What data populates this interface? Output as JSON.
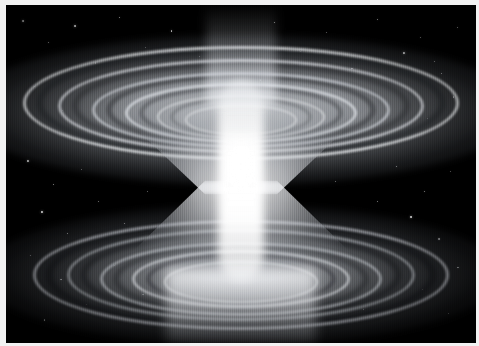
{
  "image": {
    "kind": "astronomical-visualization",
    "subject": "wormhole",
    "alt_text": "Grayscale rendering of a wormhole: an hourglass-shaped funnel with concentric accretion-disk rings flaring outward above and below a narrow bright throat, set against a black starfield.",
    "palette": "grayscale",
    "width_px": 479,
    "height_px": 346
  },
  "frame": {
    "border_color": "#f2f2f2",
    "inset_left_px": 6,
    "inset_top_px": 5
  },
  "scene": {
    "background_color": "#000000",
    "highlight_color": "#ffffff",
    "midtone_color": "#8c9096",
    "shadow_color": "#0a0b0d",
    "texture": "vertical-scanlines"
  },
  "features": [
    {
      "name": "upper-accretion-disk",
      "label": "Upper accretion disk",
      "center_x_pct": 50,
      "center_y_pct": 31,
      "ring_count": 5
    },
    {
      "name": "lower-accretion-disk",
      "label": "Lower accretion disk",
      "center_x_pct": 50,
      "center_y_pct": 80,
      "ring_count": 5
    },
    {
      "name": "wormhole-throat",
      "label": "Wormhole throat",
      "center_x_pct": 50,
      "center_y_pct": 52,
      "narrowest_width_px": 30
    },
    {
      "name": "upper-light-beam",
      "label": "Upper light beam",
      "center_x_pct": 50,
      "top_pct": 0
    },
    {
      "name": "lower-light-beam",
      "label": "Lower light glow",
      "center_x_pct": 50,
      "bottom_pct": 0
    }
  ],
  "upper_rings": [
    {
      "w": 430,
      "h": 108,
      "y": 29,
      "color": "rgba(236,238,241,0.85)",
      "thickness": 3,
      "blur": 1.2
    },
    {
      "w": 360,
      "h": 88,
      "y": 30,
      "color": "rgba(222,225,230,0.80)",
      "thickness": 3,
      "blur": 1.2
    },
    {
      "w": 292,
      "h": 70,
      "y": 31,
      "color": "rgba(208,212,218,0.78)",
      "thickness": 3,
      "blur": 1.1
    },
    {
      "w": 226,
      "h": 54,
      "y": 32,
      "color": "rgba(226,229,234,0.82)",
      "thickness": 3,
      "blur": 1.0
    },
    {
      "w": 164,
      "h": 40,
      "y": 33,
      "color": "rgba(240,242,245,0.80)",
      "thickness": 2,
      "blur": 0.9
    },
    {
      "w": 108,
      "h": 27,
      "y": 34,
      "color": "rgba(248,249,251,0.72)",
      "thickness": 2,
      "blur": 0.8
    }
  ],
  "upper_gaps": [
    {
      "w": 396,
      "h": 98,
      "y": 29,
      "color": "rgba(30,32,36,0.55)",
      "thickness": 7,
      "blur": 2.2
    },
    {
      "w": 326,
      "h": 79,
      "y": 30,
      "color": "rgba(36,38,43,0.52)",
      "thickness": 6,
      "blur": 2.0
    },
    {
      "w": 258,
      "h": 62,
      "y": 31,
      "color": "rgba(44,46,51,0.48)",
      "thickness": 6,
      "blur": 1.8
    },
    {
      "w": 194,
      "h": 47,
      "y": 32,
      "color": "rgba(52,55,60,0.42)",
      "thickness": 5,
      "blur": 1.6
    },
    {
      "w": 134,
      "h": 33,
      "y": 33,
      "color": "rgba(62,65,70,0.35)",
      "thickness": 4,
      "blur": 1.4
    }
  ],
  "lower_rings": [
    {
      "w": 410,
      "h": 104,
      "y": 80,
      "color": "rgba(196,200,206,0.70)",
      "thickness": 3,
      "blur": 1.3
    },
    {
      "w": 342,
      "h": 86,
      "y": 80,
      "color": "rgba(182,186,192,0.68)",
      "thickness": 3,
      "blur": 1.2
    },
    {
      "w": 276,
      "h": 68,
      "y": 81,
      "color": "rgba(200,204,210,0.70)",
      "thickness": 3,
      "blur": 1.1
    },
    {
      "w": 212,
      "h": 52,
      "y": 81,
      "color": "rgba(222,225,230,0.74)",
      "thickness": 3,
      "blur": 1.0
    },
    {
      "w": 150,
      "h": 38,
      "y": 82,
      "color": "rgba(240,242,245,0.72)",
      "thickness": 2,
      "blur": 0.9
    }
  ],
  "lower_gaps": [
    {
      "w": 376,
      "h": 95,
      "y": 80,
      "color": "rgba(18,19,22,0.62)",
      "thickness": 8,
      "blur": 2.4
    },
    {
      "w": 308,
      "h": 77,
      "y": 80,
      "color": "rgba(24,26,29,0.58)",
      "thickness": 7,
      "blur": 2.2
    },
    {
      "w": 244,
      "h": 60,
      "y": 81,
      "color": "rgba(32,34,38,0.52)",
      "thickness": 6,
      "blur": 2.0
    },
    {
      "w": 180,
      "h": 44,
      "y": 81,
      "color": "rgba(40,42,47,0.44)",
      "thickness": 5,
      "blur": 1.7
    }
  ],
  "stars": [
    {
      "x": 3.5,
      "y": 4.5,
      "s": 1.4,
      "o": 0.75
    },
    {
      "x": 9.0,
      "y": 11.0,
      "s": 1.2,
      "o": 0.62
    },
    {
      "x": 14.5,
      "y": 6.0,
      "s": 1.6,
      "o": 0.85
    },
    {
      "x": 19.0,
      "y": 17.0,
      "s": 1.1,
      "o": 0.55
    },
    {
      "x": 24.0,
      "y": 3.5,
      "s": 1.3,
      "o": 0.7
    },
    {
      "x": 29.5,
      "y": 12.5,
      "s": 1.0,
      "o": 0.48
    },
    {
      "x": 35.0,
      "y": 7.5,
      "s": 1.5,
      "o": 0.8
    },
    {
      "x": 41.0,
      "y": 15.0,
      "s": 1.1,
      "o": 0.52
    },
    {
      "x": 57.0,
      "y": 5.0,
      "s": 1.3,
      "o": 0.72
    },
    {
      "x": 62.5,
      "y": 13.5,
      "s": 1.2,
      "o": 0.6
    },
    {
      "x": 68.0,
      "y": 8.0,
      "s": 1.0,
      "o": 0.5
    },
    {
      "x": 73.5,
      "y": 18.5,
      "s": 1.5,
      "o": 0.82
    },
    {
      "x": 79.0,
      "y": 4.0,
      "s": 1.2,
      "o": 0.66
    },
    {
      "x": 84.5,
      "y": 14.0,
      "s": 1.7,
      "o": 0.9
    },
    {
      "x": 88.0,
      "y": 9.5,
      "s": 1.1,
      "o": 0.55
    },
    {
      "x": 92.5,
      "y": 20.0,
      "s": 1.4,
      "o": 0.76
    },
    {
      "x": 96.0,
      "y": 6.5,
      "s": 1.2,
      "o": 0.64
    },
    {
      "x": 91.0,
      "y": 16.5,
      "s": 1.3,
      "o": 0.7
    },
    {
      "x": 6.0,
      "y": 24.0,
      "s": 1.2,
      "o": 0.58
    },
    {
      "x": 12.0,
      "y": 31.0,
      "s": 1.0,
      "o": 0.45
    },
    {
      "x": 95.0,
      "y": 27.0,
      "s": 1.3,
      "o": 0.68
    },
    {
      "x": 89.5,
      "y": 33.5,
      "s": 1.1,
      "o": 0.52
    },
    {
      "x": 4.5,
      "y": 46.0,
      "s": 1.5,
      "o": 0.8
    },
    {
      "x": 10.0,
      "y": 53.0,
      "s": 1.2,
      "o": 0.6
    },
    {
      "x": 16.0,
      "y": 48.5,
      "s": 1.0,
      "o": 0.46
    },
    {
      "x": 7.5,
      "y": 61.0,
      "s": 1.6,
      "o": 0.86
    },
    {
      "x": 13.0,
      "y": 67.5,
      "s": 1.3,
      "o": 0.7
    },
    {
      "x": 19.5,
      "y": 58.0,
      "s": 1.1,
      "o": 0.54
    },
    {
      "x": 25.0,
      "y": 64.5,
      "s": 1.4,
      "o": 0.74
    },
    {
      "x": 5.0,
      "y": 74.0,
      "s": 1.2,
      "o": 0.62
    },
    {
      "x": 11.5,
      "y": 81.0,
      "s": 1.5,
      "o": 0.78
    },
    {
      "x": 17.0,
      "y": 88.5,
      "s": 1.1,
      "o": 0.5
    },
    {
      "x": 23.0,
      "y": 77.0,
      "s": 1.0,
      "o": 0.44
    },
    {
      "x": 29.0,
      "y": 85.5,
      "s": 1.3,
      "o": 0.66
    },
    {
      "x": 8.0,
      "y": 93.0,
      "s": 1.2,
      "o": 0.58
    },
    {
      "x": 83.0,
      "y": 47.5,
      "s": 1.4,
      "o": 0.76
    },
    {
      "x": 89.0,
      "y": 55.0,
      "s": 1.2,
      "o": 0.62
    },
    {
      "x": 94.5,
      "y": 49.0,
      "s": 1.0,
      "o": 0.46
    },
    {
      "x": 86.0,
      "y": 62.5,
      "s": 1.6,
      "o": 0.84
    },
    {
      "x": 92.0,
      "y": 69.0,
      "s": 1.3,
      "o": 0.68
    },
    {
      "x": 79.0,
      "y": 58.0,
      "s": 1.1,
      "o": 0.52
    },
    {
      "x": 96.0,
      "y": 77.5,
      "s": 1.4,
      "o": 0.72
    },
    {
      "x": 88.5,
      "y": 84.0,
      "s": 1.2,
      "o": 0.6
    },
    {
      "x": 94.0,
      "y": 91.0,
      "s": 1.0,
      "o": 0.44
    },
    {
      "x": 76.0,
      "y": 90.0,
      "s": 1.3,
      "o": 0.64
    },
    {
      "x": 33.0,
      "y": 43.0,
      "s": 1.1,
      "o": 0.55
    },
    {
      "x": 67.0,
      "y": 41.0,
      "s": 1.2,
      "o": 0.58
    },
    {
      "x": 30.0,
      "y": 55.0,
      "s": 1.0,
      "o": 0.42
    },
    {
      "x": 70.0,
      "y": 52.0,
      "s": 1.1,
      "o": 0.48
    },
    {
      "x": 46.0,
      "y": 30.0,
      "s": 1.3,
      "o": 0.7
    },
    {
      "x": 54.0,
      "y": 22.0,
      "s": 1.2,
      "o": 0.62
    },
    {
      "x": 52.0,
      "y": 48.0,
      "s": 1.5,
      "o": 0.88
    },
    {
      "x": 48.0,
      "y": 72.0,
      "s": 1.3,
      "o": 0.72
    },
    {
      "x": 58.0,
      "y": 79.0,
      "s": 1.2,
      "o": 0.6
    },
    {
      "x": 42.0,
      "y": 83.0,
      "s": 1.1,
      "o": 0.52
    }
  ]
}
